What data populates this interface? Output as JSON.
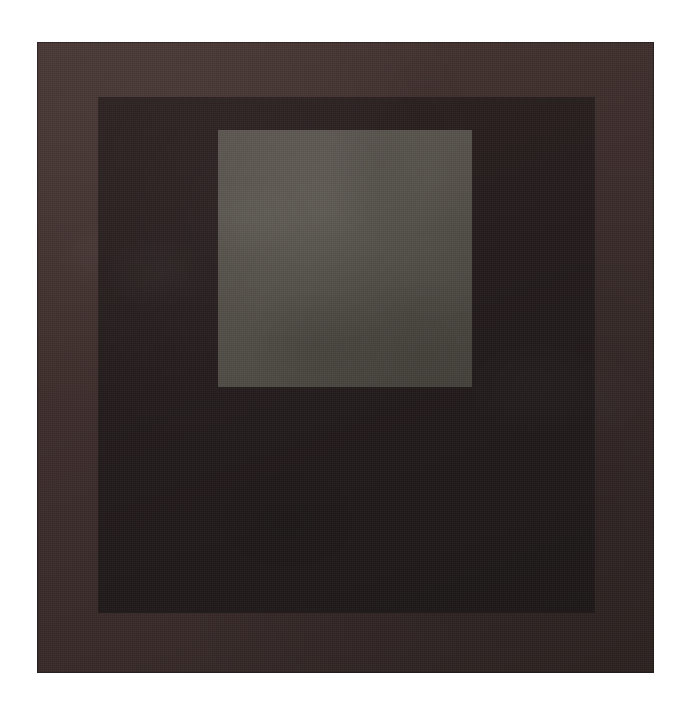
{
  "artwork": {
    "background_color": "#ffffff",
    "canvas_width": 688,
    "canvas_height": 708,
    "composition": "nested-squares",
    "bands": [
      {
        "name": "outer",
        "label": "Outer band",
        "color": "#3e2f2d",
        "x": 37,
        "y": 42,
        "width": 617,
        "height": 631
      },
      {
        "name": "middle",
        "label": "Middle band",
        "color": "#241c1c",
        "x": 98,
        "y": 97,
        "width": 497,
        "height": 516
      },
      {
        "name": "inner",
        "label": "Inner square",
        "color": "#55504c",
        "x": 218,
        "y": 130,
        "width": 254,
        "height": 257
      }
    ]
  }
}
